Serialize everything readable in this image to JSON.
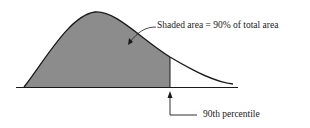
{
  "figure": {
    "annotation_shaded": "Shaded area = 90% of total area",
    "annotation_percentile": "90th percentile",
    "colors": {
      "shade": "#8c8c8c",
      "curve": "#1a1a1a",
      "text": "#222222"
    }
  }
}
